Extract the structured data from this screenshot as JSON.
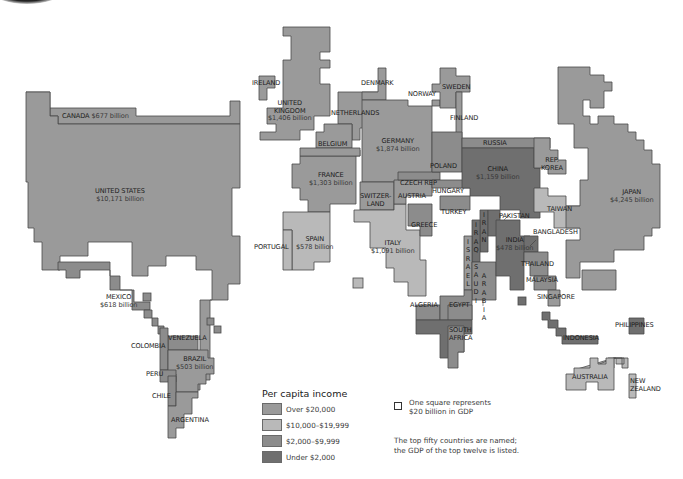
{
  "map": {
    "type": "cartogram",
    "subject": "World GDP cartogram, shaded by per capita income",
    "colors": {
      "over_20000": "#9a9a9a",
      "10000_19999": "#b9b9b9",
      "2000_9999": "#8c8c8c",
      "under_2000": "#6f6f6f",
      "border": "#4a4a4a",
      "background": "#ffffff"
    },
    "countries": {
      "canada": {
        "name": "CANADA",
        "gdp": "$677 billion"
      },
      "united_states": {
        "name": "UNITED STATES",
        "gdp": "$10,171 billion"
      },
      "mexico": {
        "name": "MEXICO",
        "gdp": "$618 billion"
      },
      "ireland": {
        "name": "IRELAND"
      },
      "united_kingdom": {
        "name_1": "UNITED",
        "name_2": "KINGDOM",
        "gdp": "$1,406 billion"
      },
      "denmark": {
        "name": "DENMARK"
      },
      "norway": {
        "name": "NORWAY"
      },
      "sweden": {
        "name": "SWEDEN"
      },
      "finland": {
        "name": "FINLAND"
      },
      "netherlands": {
        "name": "NETHERLANDS"
      },
      "belgium": {
        "name": "BELGIUM"
      },
      "germany": {
        "name": "GERMANY",
        "gdp": "$1,874 billion"
      },
      "france": {
        "name": "FRANCE",
        "gdp": "$1,303 billion"
      },
      "poland": {
        "name": "POLAND"
      },
      "czech_rep": {
        "name": "CZECH REP"
      },
      "hungary": {
        "name": "HUNGARY"
      },
      "switzerland": {
        "name_1": "SWITZER-",
        "name_2": "LAND"
      },
      "austria": {
        "name": "AUSTRIA"
      },
      "turkey": {
        "name": "TURKEY"
      },
      "greece": {
        "name": "GREECE"
      },
      "spain": {
        "name": "SPAIN",
        "gdp": "$578 billion"
      },
      "portugal": {
        "name": "PORTUGAL"
      },
      "italy": {
        "name": "ITALY",
        "gdp": "$1,091 billion"
      },
      "russia": {
        "name": "RUSSIA"
      },
      "china": {
        "name": "CHINA",
        "gdp": "$1,159 billion"
      },
      "rep_korea": {
        "name_1": "REP.",
        "name_2": "KOREA"
      },
      "japan": {
        "name": "JAPAN",
        "gdp": "$4,245 billion"
      },
      "taiwan": {
        "name": "TAIWAN"
      },
      "pakistan": {
        "name": "PAKISTAN"
      },
      "india": {
        "name": "INDIA",
        "gdp": "$478 billion"
      },
      "bangladesh": {
        "name": "BANGLADESH"
      },
      "thailand": {
        "name": "THAILAND"
      },
      "malaysia": {
        "name": "MALAYSIA"
      },
      "singapore": {
        "name": "SINGAPORE"
      },
      "philippines": {
        "name": "PHILIPPINES"
      },
      "indonesia": {
        "name": "INDONESIA"
      },
      "australia": {
        "name": "AUSTRALIA"
      },
      "new_zealand": {
        "name_1": "NEW",
        "name_2": "ZEALAND"
      },
      "iran": {
        "name": "I\nR\nA\nN"
      },
      "iraq": {
        "name": "I\nR\nA\nQ"
      },
      "israel": {
        "name": "I\nS\nR\nA\nE\nL"
      },
      "saudi_arabia": {
        "name_1": "S\nA\nU\nD\nI",
        "name_2": "A\nR\nA\nB\nI\nA"
      },
      "algeria": {
        "name": "ALGERIA"
      },
      "egypt": {
        "name": "EGYPT"
      },
      "south_africa": {
        "name_1": "SOUTH",
        "name_2": "AFRICA"
      },
      "venezuela": {
        "name": "VENEZUELA"
      },
      "colombia": {
        "name": "COLOMBIA"
      },
      "brazil": {
        "name": "BRAZIL",
        "gdp": "$503 billion"
      },
      "peru": {
        "name": "PERU"
      },
      "chile": {
        "name": "CHILE"
      },
      "argentina": {
        "name": "ARGENTINA"
      }
    }
  },
  "legend": {
    "title": "Per capita income",
    "items": [
      {
        "label": "Over $20,000",
        "color": "#9a9a9a"
      },
      {
        "label": "$10,000–$19,999",
        "color": "#b9b9b9"
      },
      {
        "label": "$2,000–$9,999",
        "color": "#8c8c8c"
      },
      {
        "label": "Under $2,000",
        "color": "#6f6f6f"
      }
    ]
  },
  "notes": {
    "square_line1": "One square represents",
    "square_line2": "$20 billion in GDP",
    "naming_line1": "The top fifty countries are named;",
    "naming_line2": "the GDP of the top twelve is listed."
  }
}
